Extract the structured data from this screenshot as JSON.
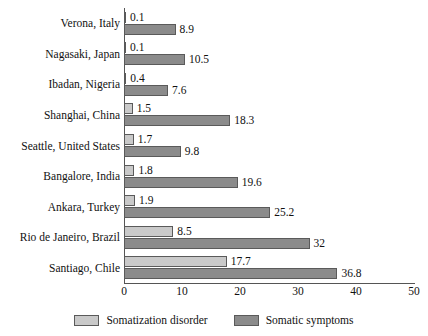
{
  "chart_data": {
    "type": "bar",
    "orientation": "horizontal",
    "title": "",
    "subtitle": "",
    "xlabel": "",
    "ylabel": "",
    "xlim": [
      0,
      50
    ],
    "xticks": [
      "0",
      "10",
      "20",
      "30",
      "40",
      "50"
    ],
    "grid": false,
    "legend_position": "bottom",
    "categories": [
      "Verona, Italy",
      "Nagasaki, Japan",
      "Ibadan, Nigeria",
      "Shanghai, China",
      "Seattle, United States",
      "Bangalore, India",
      "Ankara, Turkey",
      "Rio de Janeiro, Brazil",
      "Santiago, Chile"
    ],
    "series": [
      {
        "name": "Somatization disorder",
        "color": "#c9c9c9",
        "values": [
          0.1,
          0.1,
          0.4,
          1.5,
          1.7,
          1.8,
          1.9,
          8.5,
          17.7
        ],
        "labels": [
          "0.1",
          "0.1",
          "0.4",
          "1.5",
          "1.7",
          "1.8",
          "1.9",
          "8.5",
          "17.7"
        ]
      },
      {
        "name": "Somatic symptoms",
        "color": "#8b8b8b",
        "values": [
          8.9,
          10.5,
          7.6,
          18.3,
          9.8,
          19.6,
          25.2,
          32,
          36.8
        ],
        "labels": [
          "8.9",
          "10.5",
          "7.6",
          "18.3",
          "9.8",
          "19.6",
          "25.2",
          "32",
          "36.8"
        ]
      }
    ]
  },
  "legend": {
    "items": [
      {
        "label": "Somatization disorder",
        "swatch": "light"
      },
      {
        "label": "Somatic symptoms",
        "swatch": "dark"
      }
    ]
  }
}
